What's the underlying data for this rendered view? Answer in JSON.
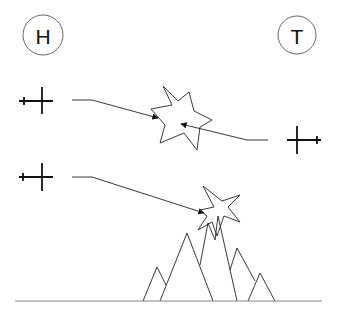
{
  "labels": {
    "left_marker": "H",
    "right_marker": "T"
  },
  "colors": {
    "ink": "#222222",
    "background": "#ffffff"
  },
  "elements": {
    "aircraft": [
      {
        "id": "aircraft-left-top",
        "direction": "right"
      },
      {
        "id": "aircraft-right",
        "direction": "left"
      },
      {
        "id": "aircraft-left-bottom",
        "direction": "right"
      }
    ],
    "explosions": [
      "midair-collision-star",
      "ground-impact-star"
    ],
    "terrain": "mountain-range"
  }
}
